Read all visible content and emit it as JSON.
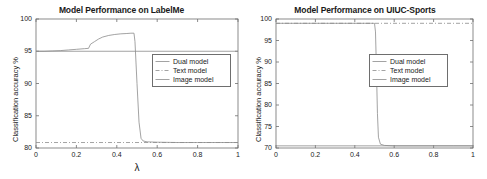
{
  "figure": {
    "panel_count": 2,
    "background_color": "#ffffff",
    "axis_color": "#6e6e6e",
    "text_color": "#1a1a1a"
  },
  "chart_data": [
    {
      "type": "line",
      "panel": "left",
      "title": "Model Performance on LabelMe",
      "xlabel": "λ",
      "ylabel": "Classification accuracy %",
      "xlim": [
        0,
        1
      ],
      "ylim": [
        80,
        100
      ],
      "xticks": [
        0,
        0.2,
        0.4,
        0.6,
        0.8,
        1
      ],
      "xticklabels": [
        "0",
        "0.2",
        "0.4",
        "0.6",
        "0.8",
        "1"
      ],
      "yticks": [
        80,
        85,
        90,
        95,
        100
      ],
      "yticklabels": [
        "80",
        "85",
        "90",
        "95",
        "100"
      ],
      "grid": false,
      "legend_position": "center-right",
      "series": [
        {
          "name": "Dual model",
          "style": "solid",
          "color": "#8c8c8c",
          "x": [
            0,
            0.04,
            0.08,
            0.12,
            0.16,
            0.2,
            0.24,
            0.26,
            0.27,
            0.29,
            0.31,
            0.33,
            0.36,
            0.39,
            0.42,
            0.45,
            0.47,
            0.48,
            0.485,
            0.49,
            0.5,
            0.51,
            0.52,
            0.53,
            0.55,
            0.6,
            0.7,
            0.8,
            0.9,
            1
          ],
          "values": [
            95.0,
            95.0,
            95.05,
            95.1,
            95.2,
            95.3,
            95.4,
            95.45,
            96.1,
            96.5,
            96.9,
            97.2,
            97.45,
            97.6,
            97.7,
            97.75,
            97.8,
            97.8,
            97.8,
            96.5,
            90.0,
            84.0,
            81.5,
            81.1,
            80.95,
            80.9,
            80.85,
            80.85,
            80.85,
            80.85
          ]
        },
        {
          "name": "Text model",
          "style": "dash-dot",
          "color": "#8c8c8c",
          "x": [
            0,
            1
          ],
          "values": [
            80.85,
            80.85
          ]
        },
        {
          "name": "Image model",
          "style": "solid",
          "color": "#8c8c8c",
          "x": [
            0,
            1
          ],
          "values": [
            95.0,
            95.0
          ]
        }
      ]
    },
    {
      "type": "line",
      "panel": "right",
      "title": "Model Performance on UIUC-Sports",
      "xlabel": "",
      "ylabel": "Classification accuracy %",
      "xlim": [
        0,
        1
      ],
      "ylim": [
        70,
        100
      ],
      "xticks": [
        0,
        0.2,
        0.4,
        0.6,
        0.8,
        1
      ],
      "xticklabels": [
        "0",
        "0.2",
        "0.4",
        "0.6",
        "0.8",
        "1"
      ],
      "yticks": [
        70,
        75,
        80,
        85,
        90,
        95,
        100
      ],
      "yticklabels": [
        "70",
        "75",
        "80",
        "85",
        "90",
        "95",
        "100"
      ],
      "grid": false,
      "legend_position": "center-right",
      "series": [
        {
          "name": "Dual model",
          "style": "solid",
          "color": "#8c8c8c",
          "x": [
            0,
            0.1,
            0.2,
            0.3,
            0.4,
            0.45,
            0.48,
            0.5,
            0.505,
            0.51,
            0.515,
            0.52,
            0.53,
            0.55,
            0.6,
            0.7,
            0.8,
            0.9,
            1
          ],
          "values": [
            99.0,
            99.0,
            99.0,
            99.0,
            99.0,
            99.0,
            99.0,
            99.0,
            97.0,
            88.0,
            78.0,
            72.5,
            70.9,
            70.6,
            70.5,
            70.5,
            70.5,
            70.5,
            70.5
          ]
        },
        {
          "name": "Text model",
          "style": "dash-dot",
          "color": "#8c8c8c",
          "x": [
            0,
            1
          ],
          "values": [
            99.0,
            99.0
          ]
        },
        {
          "name": "Image model",
          "style": "solid",
          "color": "#8c8c8c",
          "x": [
            0,
            1
          ],
          "values": [
            70.5,
            70.5
          ]
        }
      ]
    }
  ],
  "legend": {
    "entries": [
      {
        "label": "Dual model",
        "style": "solid"
      },
      {
        "label": "Text model",
        "style": "dash-dot"
      },
      {
        "label": "Image model",
        "style": "solid"
      }
    ]
  }
}
